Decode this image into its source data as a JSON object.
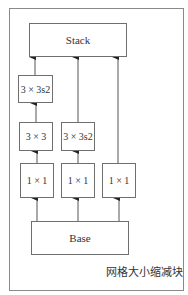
{
  "diagram": {
    "title": "网格大小缩减块",
    "nodes": {
      "stack": {
        "label": "Stack"
      },
      "col1_top": {
        "label": "3 × 3s2"
      },
      "col1_mid": {
        "label": "3 × 3"
      },
      "col2_mid": {
        "label": "3 × 3s2"
      },
      "col1_bot": {
        "label": "1 × 1"
      },
      "col2_bot": {
        "label": "1 × 1"
      },
      "col3_bot": {
        "label": "1 × 1"
      },
      "base": {
        "label": "Base"
      }
    },
    "edges": [
      {
        "from": "base",
        "to": "col1_bot"
      },
      {
        "from": "base",
        "to": "col2_bot"
      },
      {
        "from": "base",
        "to": "col3_bot"
      },
      {
        "from": "col1_bot",
        "to": "col1_mid"
      },
      {
        "from": "col1_mid",
        "to": "col1_top"
      },
      {
        "from": "col1_top",
        "to": "stack"
      },
      {
        "from": "col2_bot",
        "to": "col2_mid"
      },
      {
        "from": "col2_mid",
        "to": "stack"
      },
      {
        "from": "col3_bot",
        "to": "stack"
      }
    ]
  }
}
